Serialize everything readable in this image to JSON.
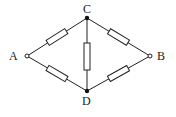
{
  "diagram": {
    "type": "bridge-circuit",
    "nodes": [
      {
        "id": "A",
        "label": "A",
        "x": 27,
        "y": 56,
        "style": "open-terminal"
      },
      {
        "id": "B",
        "label": "B",
        "x": 150,
        "y": 56,
        "style": "open-terminal"
      },
      {
        "id": "C",
        "label": "C",
        "x": 87,
        "y": 18,
        "style": "junction"
      },
      {
        "id": "D",
        "label": "D",
        "x": 87,
        "y": 91,
        "style": "junction"
      }
    ],
    "edges": [
      {
        "from": "A",
        "to": "C",
        "component": "resistor"
      },
      {
        "from": "A",
        "to": "D",
        "component": "resistor"
      },
      {
        "from": "C",
        "to": "B",
        "component": "resistor"
      },
      {
        "from": "D",
        "to": "B",
        "component": "resistor"
      },
      {
        "from": "C",
        "to": "D",
        "component": "resistor"
      }
    ],
    "colors": {
      "line": "#222222",
      "background": "#ffffff"
    }
  }
}
